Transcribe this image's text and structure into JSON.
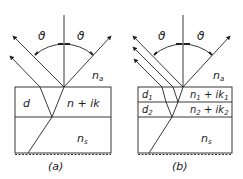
{
  "panels": [
    {
      "caption": "(a)",
      "ambient": "n",
      "ambient_sub": "a",
      "angle_left": "ϑ",
      "angle_right": "ϑ",
      "layers": [
        {
          "thickness": "d",
          "index": "n + ik"
        }
      ],
      "substrate": "n",
      "substrate_sub": "s"
    },
    {
      "caption": "(b)",
      "ambient": "n",
      "ambient_sub": "a",
      "angle_left": "ϑ",
      "angle_right": "ϑ",
      "layers": [
        {
          "thickness": "d",
          "thickness_sub": "1",
          "index_a": "n",
          "index_a_sub": "1",
          "index_b": " + ik",
          "index_b_sub": "1"
        },
        {
          "thickness": "d",
          "thickness_sub": "2",
          "index_a": "n",
          "index_a_sub": "2",
          "index_b": " + ik",
          "index_b_sub": "2"
        }
      ],
      "substrate": "n",
      "substrate_sub": "s"
    }
  ],
  "colors": {
    "line": "#222222",
    "background": "#ffffff"
  }
}
